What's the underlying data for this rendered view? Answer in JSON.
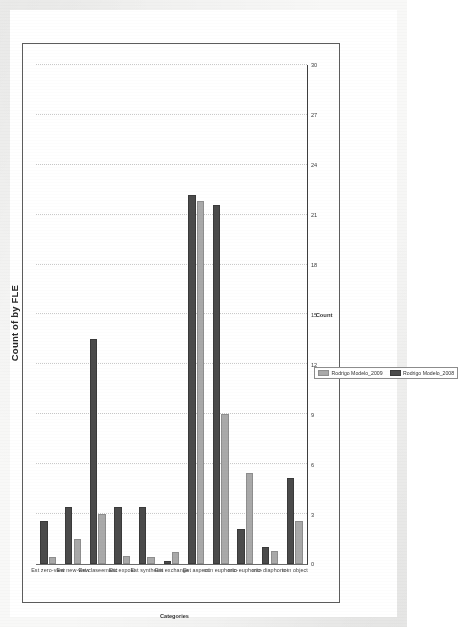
{
  "chart_data": {
    "type": "bar",
    "orientation": "horizontal",
    "title": "Count of  by FLE",
    "xlabel": "Count",
    "ylabel": "Categories",
    "xlim": [
      0,
      30
    ],
    "xticks": [
      0,
      3,
      6,
      9,
      12,
      15,
      18,
      21,
      24,
      27,
      30
    ],
    "xtick_labels": [
      "0",
      "3",
      "6",
      "9",
      "12",
      "15",
      "18",
      "21",
      "24",
      "27",
      "30"
    ],
    "grid": true,
    "grid_axis": "x",
    "legend_position": "bottom-right",
    "categories": [
      "Est zero-view",
      "Est new-view",
      "Est claseematic",
      "Est expost",
      "Est synthesis",
      "Est exchange",
      "Est aspect",
      "mtn euphoric-",
      "mtn euphoric-",
      "mtn diaphoric-",
      "mtn object"
    ],
    "series": [
      {
        "name": "Rodrigo Modelo_2009",
        "color": "#a9a9a9",
        "values": [
          0.4,
          1.5,
          3.0,
          0.5,
          0.4,
          0.7,
          21.8,
          9.0,
          5.5,
          0.8,
          2.6
        ]
      },
      {
        "name": "Rodrigo Modelo_2008",
        "color": "#4b4b4b",
        "values": [
          2.6,
          3.4,
          13.5,
          3.4,
          3.4,
          0.2,
          22.2,
          21.6,
          2.1,
          1.0,
          5.2
        ]
      }
    ]
  },
  "title": {
    "text": "Count of  by FLE"
  },
  "axes": {
    "x_title": "Count",
    "y_title": "Categories"
  },
  "legend": {
    "items": [
      {
        "label": "Rodrigo Modelo_2009",
        "color": "#a9a9a9"
      },
      {
        "label": "Rodrigo Modelo_2008",
        "color": "#4b4b4b"
      }
    ]
  },
  "ticks": {
    "x": [
      "0",
      "3",
      "6",
      "9",
      "12",
      "15",
      "18",
      "21",
      "24",
      "27",
      "30"
    ]
  },
  "categories": [
    "Est zero-view",
    "Est new-view",
    "Est claseematic",
    "Est expost",
    "Est synthesis",
    "Est exchange",
    "Est aspect",
    "mtn euphoric-",
    "mtn euphoric-",
    "mtn diaphoric-",
    "mtn object"
  ],
  "colors": {
    "series_light": "#a9a9a9",
    "series_dark": "#4b4b4b",
    "grid": "#c9c9c9",
    "axis": "#3e3e3e",
    "frame": "#5d5d5d",
    "text": "#333333",
    "paper": "#f8f8f7"
  }
}
